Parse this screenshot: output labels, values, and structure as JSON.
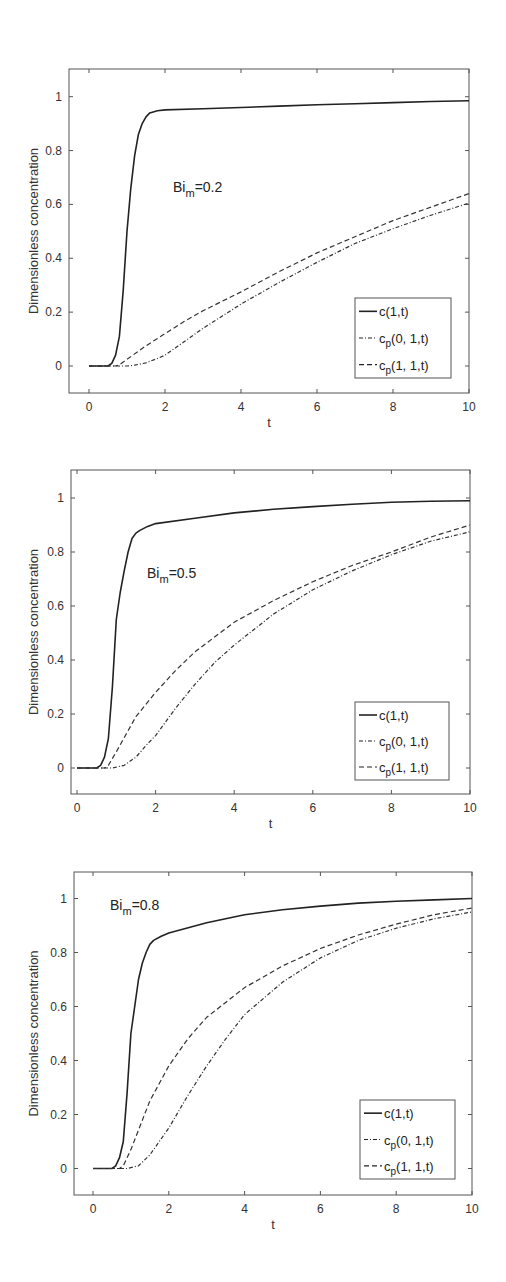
{
  "chart_data": [
    {
      "type": "line",
      "title": "",
      "annotation": {
        "base": "Bi",
        "sub": "m",
        "value": "=0.2"
      },
      "xlabel": "t",
      "ylabel": "Dimensionless concentration",
      "xlim": [
        -0.4,
        10
      ],
      "ylim": [
        -0.1,
        1.1
      ],
      "xticks": [
        0,
        2,
        4,
        6,
        8,
        10
      ],
      "yticks": [
        0,
        0.2,
        0.4,
        0.6,
        0.8,
        1
      ],
      "grid": false,
      "legend_position": "lower right",
      "series": [
        {
          "name": "c(1,t)",
          "label_base": "c",
          "label_sub": "",
          "label_args": "(1,t)",
          "style": "solid",
          "x": [
            0,
            0.5,
            0.6,
            0.7,
            0.8,
            0.9,
            1.0,
            1.1,
            1.2,
            1.3,
            1.4,
            1.5,
            1.6,
            1.8,
            2,
            3,
            4,
            5,
            6,
            7,
            8,
            9,
            10
          ],
          "y": [
            0,
            0,
            0.01,
            0.04,
            0.11,
            0.28,
            0.5,
            0.66,
            0.78,
            0.86,
            0.9,
            0.925,
            0.94,
            0.948,
            0.951,
            0.955,
            0.96,
            0.965,
            0.97,
            0.974,
            0.978,
            0.982,
            0.985
          ]
        },
        {
          "name": "cp(0, 1,t)",
          "label_base": "c",
          "label_sub": "p",
          "label_args": "(0, 1,t)",
          "style": "dashdot",
          "x": [
            0,
            1.0,
            1.2,
            1.5,
            1.8,
            2,
            2.5,
            3,
            3.5,
            4,
            5,
            6,
            7,
            8,
            9,
            10
          ],
          "y": [
            0,
            0,
            0.003,
            0.012,
            0.028,
            0.04,
            0.09,
            0.14,
            0.185,
            0.23,
            0.31,
            0.385,
            0.455,
            0.51,
            0.56,
            0.605
          ]
        },
        {
          "name": "cp(1, 1,t)",
          "label_base": "c",
          "label_sub": "p",
          "label_args": "(1, 1,t)",
          "style": "dashed",
          "x": [
            0,
            0.7,
            0.8,
            1.0,
            1.5,
            2,
            2.5,
            3,
            4,
            5,
            6,
            7,
            8,
            9,
            10
          ],
          "y": [
            0,
            0,
            0.005,
            0.025,
            0.075,
            0.12,
            0.165,
            0.205,
            0.275,
            0.35,
            0.42,
            0.48,
            0.54,
            0.59,
            0.64
          ]
        }
      ]
    },
    {
      "type": "line",
      "title": "",
      "annotation": {
        "base": "Bi",
        "sub": "m",
        "value": "=0.5"
      },
      "xlabel": "t",
      "ylabel": "Dimensionless concentration",
      "xlim": [
        -0.1,
        10
      ],
      "ylim": [
        -0.1,
        1.1
      ],
      "xticks": [
        0,
        2,
        4,
        6,
        8,
        10
      ],
      "yticks": [
        0,
        0.2,
        0.4,
        0.6,
        0.8,
        1
      ],
      "grid": false,
      "legend_position": "lower right",
      "series": [
        {
          "name": "c(1,t)",
          "label_base": "c",
          "label_sub": "",
          "label_args": "(1,t)",
          "style": "solid",
          "x": [
            0,
            0.5,
            0.6,
            0.7,
            0.8,
            0.9,
            1.0,
            1.1,
            1.2,
            1.3,
            1.4,
            1.5,
            1.6,
            1.8,
            2,
            3,
            4,
            5,
            6,
            7,
            8,
            9,
            10
          ],
          "y": [
            0,
            0,
            0.01,
            0.04,
            0.11,
            0.3,
            0.55,
            0.65,
            0.73,
            0.8,
            0.85,
            0.87,
            0.88,
            0.895,
            0.905,
            0.925,
            0.945,
            0.958,
            0.968,
            0.977,
            0.984,
            0.988,
            0.99
          ]
        },
        {
          "name": "cp(0, 1,t)",
          "label_base": "c",
          "label_sub": "p",
          "label_args": "(0, 1,t)",
          "style": "dashdot",
          "x": [
            0,
            0.9,
            1.2,
            1.5,
            1.8,
            2,
            2.5,
            3,
            3.5,
            4,
            5,
            6,
            7,
            8,
            9,
            10
          ],
          "y": [
            0,
            0,
            0.01,
            0.04,
            0.09,
            0.12,
            0.22,
            0.31,
            0.39,
            0.455,
            0.57,
            0.66,
            0.73,
            0.79,
            0.84,
            0.875
          ]
        },
        {
          "name": "cp(1, 1,t)",
          "label_base": "c",
          "label_sub": "p",
          "label_args": "(1, 1,t)",
          "style": "dashed",
          "x": [
            0,
            0.7,
            0.8,
            1.0,
            1.5,
            2,
            2.5,
            3,
            4,
            5,
            6,
            7,
            8,
            9,
            10
          ],
          "y": [
            0,
            0,
            0.01,
            0.06,
            0.19,
            0.28,
            0.36,
            0.43,
            0.54,
            0.62,
            0.69,
            0.75,
            0.8,
            0.855,
            0.9
          ]
        }
      ]
    },
    {
      "type": "line",
      "title": "",
      "annotation": {
        "base": "Bi",
        "sub": "m",
        "value": "=0.8"
      },
      "xlabel": "t",
      "ylabel": "Dimensionless concentration",
      "xlim": [
        -0.4,
        10
      ],
      "ylim": [
        -0.1,
        1.1
      ],
      "xticks": [
        0,
        2,
        4,
        6,
        8,
        10
      ],
      "yticks": [
        0,
        0.2,
        0.4,
        0.6,
        0.8,
        1
      ],
      "grid": false,
      "legend_position": "lower right",
      "series": [
        {
          "name": "c(1,t)",
          "label_base": "c",
          "label_sub": "",
          "label_args": "(1,t)",
          "style": "solid",
          "x": [
            0,
            0.5,
            0.6,
            0.7,
            0.8,
            0.9,
            1.0,
            1.1,
            1.2,
            1.3,
            1.4,
            1.5,
            1.6,
            1.8,
            2,
            3,
            4,
            5,
            6,
            7,
            8,
            9,
            10
          ],
          "y": [
            0,
            0,
            0.01,
            0.04,
            0.1,
            0.28,
            0.5,
            0.6,
            0.7,
            0.76,
            0.8,
            0.83,
            0.845,
            0.86,
            0.872,
            0.91,
            0.94,
            0.958,
            0.972,
            0.983,
            0.99,
            0.995,
            1.0
          ]
        },
        {
          "name": "cp(0, 1,t)",
          "label_base": "c",
          "label_sub": "p",
          "label_args": "(0, 1,t)",
          "style": "dashdot",
          "x": [
            0,
            0.9,
            1.2,
            1.5,
            1.8,
            2,
            2.5,
            3,
            3.5,
            4,
            5,
            6,
            7,
            8,
            9,
            10
          ],
          "y": [
            0,
            0,
            0.01,
            0.05,
            0.11,
            0.15,
            0.27,
            0.38,
            0.48,
            0.57,
            0.69,
            0.78,
            0.845,
            0.89,
            0.925,
            0.95
          ]
        },
        {
          "name": "cp(1, 1,t)",
          "label_base": "c",
          "label_sub": "p",
          "label_args": "(1, 1,t)",
          "style": "dashed",
          "x": [
            0,
            0.7,
            0.8,
            1.0,
            1.5,
            2,
            2.5,
            3,
            4,
            5,
            6,
            7,
            8,
            9,
            10
          ],
          "y": [
            0,
            0,
            0.01,
            0.07,
            0.25,
            0.38,
            0.48,
            0.56,
            0.67,
            0.75,
            0.815,
            0.865,
            0.905,
            0.94,
            0.965
          ]
        }
      ]
    }
  ],
  "layout": {
    "panels": [
      {
        "box": [
          69,
          69,
          469,
          393
        ],
        "y1_px": 96.7,
        "y0_px": 366,
        "x0_px": 89,
        "x10_px": 469,
        "legend": [
          355,
          298,
          451,
          378
        ],
        "annot_xy": [
          173,
          192
        ]
      },
      {
        "box": [
          71,
          470,
          470,
          794
        ],
        "y1_px": 498,
        "y0_px": 768,
        "x0_px": 77,
        "x10_px": 470,
        "legend": [
          355,
          702,
          449,
          780
        ],
        "annot_xy": [
          147,
          578
        ]
      },
      {
        "box": [
          74,
          872,
          472,
          1195
        ],
        "y1_px": 898.5,
        "y0_px": 1168.5,
        "x0_px": 93,
        "x10_px": 472,
        "legend": [
          360,
          1100,
          455,
          1179
        ],
        "annot_xy": [
          110,
          910
        ]
      }
    ]
  }
}
